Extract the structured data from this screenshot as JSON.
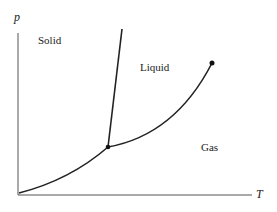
{
  "diagram": {
    "axes": {
      "x_label": "T",
      "y_label": "p"
    },
    "regions": [
      "Solid",
      "Liquid",
      "Gas"
    ],
    "points": {
      "triple_point": [
        108,
        147
      ],
      "critical_point": [
        212,
        63
      ]
    },
    "colors": {
      "line": "#222222",
      "background": "#ffffff"
    }
  }
}
